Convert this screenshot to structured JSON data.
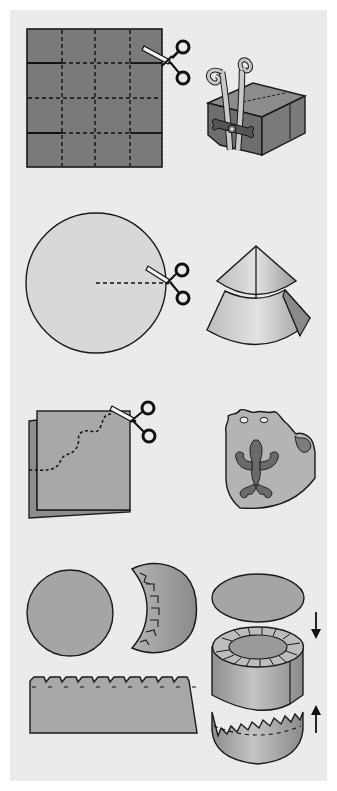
{
  "diagram": {
    "kind": "paper-craft-instructions",
    "step_count": 4,
    "colors": {
      "page": "#ffffff",
      "panel": "#ebebeb",
      "paper_dark": "#7a7a7a",
      "paper_mid": "#a8a8a8",
      "paper_light": "#d2d2d2",
      "ornament": "#6a6a6a",
      "outline": "#1a1a1a",
      "scissor_blade": "#f4f4f4"
    },
    "steps": [
      {
        "id": "box",
        "left": {
          "shape": "square-sheet-4x4-grid",
          "fill": "paper_dark",
          "cut_lines": "solid-on-outer-columns",
          "fold_lines": "dashed"
        },
        "tool": "scissors",
        "right": {
          "shape": "gift-box-with-curled-ribbon-and-bow"
        }
      },
      {
        "id": "cone",
        "left": {
          "shape": "circle-sheet",
          "fill": "paper_light",
          "cut_line": "dashed-radius"
        },
        "tool": "scissors",
        "right": {
          "shape": "two-tier-paper-cone"
        }
      },
      {
        "id": "napkin-ring",
        "left": {
          "shape": "folded-sheet-wavy-cut",
          "fill": "paper_mid",
          "cut_line": "dashed-wavy"
        },
        "tool": "scissors",
        "right": {
          "shape": "decorated-ring-with-ornament"
        }
      },
      {
        "id": "round-box",
        "pieces": [
          "circle-lid",
          "crescent-with-tabs",
          "notched-strip"
        ],
        "assembly": {
          "shape": "cylinder-box-with-lid-and-base",
          "arrows": [
            "down",
            "up"
          ]
        }
      }
    ]
  }
}
